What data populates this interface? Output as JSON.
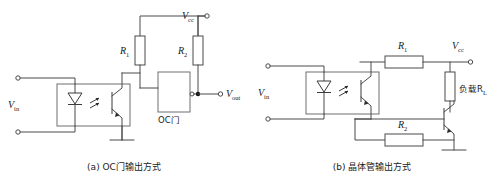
{
  "figure": {
    "title": "",
    "colors": {
      "wire": "#4a4a4a",
      "component": "#6e6e6e",
      "text": "#1a1a1a",
      "background": "#ffffff",
      "junction": "#111111"
    }
  },
  "panel_a": {
    "caption": "(a) OC门输出方式",
    "labels": {
      "vin": "V",
      "vin_sub": "in",
      "vcc": "V",
      "vcc_sub": "cc",
      "vout": "V",
      "vout_sub": "out",
      "r1": "R",
      "r1_sub": "1",
      "r2": "R",
      "r2_sub": "2",
      "gate": "OC门"
    },
    "components": [
      {
        "name": "optocoupler",
        "type": "optocoupler"
      },
      {
        "name": "resistor-r1",
        "type": "resistor",
        "orientation": "vertical"
      },
      {
        "name": "resistor-r2",
        "type": "resistor",
        "orientation": "vertical"
      },
      {
        "name": "oc-gate",
        "type": "logic-gate-open-collector"
      },
      {
        "name": "ground",
        "type": "ground"
      }
    ]
  },
  "panel_b": {
    "caption": "(b) 晶体管输出方式",
    "labels": {
      "vin": "V",
      "vin_sub": "in",
      "vcc": "V",
      "vcc_sub": "cc",
      "r1": "R",
      "r1_sub": "1",
      "r2": "R",
      "r2_sub": "2",
      "load": "负载R",
      "load_sub": "L"
    },
    "components": [
      {
        "name": "optocoupler",
        "type": "optocoupler"
      },
      {
        "name": "resistor-r1",
        "type": "resistor",
        "orientation": "horizontal"
      },
      {
        "name": "resistor-r2",
        "type": "resistor",
        "orientation": "horizontal"
      },
      {
        "name": "load-resistor",
        "type": "resistor",
        "orientation": "vertical"
      },
      {
        "name": "npn-transistor",
        "type": "transistor-npn"
      },
      {
        "name": "ground",
        "type": "ground"
      }
    ]
  }
}
